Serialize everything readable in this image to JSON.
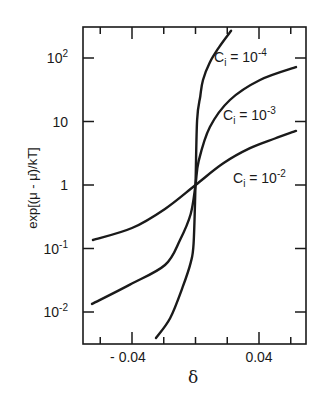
{
  "chart_data": {
    "type": "line",
    "title": "",
    "xlabel": "δ",
    "ylabel": "exp[(μ - μ̄)/kT]",
    "xscale": "linear",
    "yscale": "log",
    "xlim": [
      -0.071,
      0.07
    ],
    "ylim": [
      0.0032,
      310
    ],
    "grid": false,
    "legend": "inline labels",
    "x_ticks": {
      "major": [
        -0.04,
        0.04
      ],
      "minor": [
        -0.06,
        -0.02,
        0.0,
        0.02,
        0.06
      ],
      "labels": [
        "- 0.04",
        "0.04"
      ]
    },
    "y_ticks": {
      "values": [
        0.01,
        0.1,
        1,
        10,
        100
      ],
      "labels": [
        {
          "base": "10",
          "exp": "-2"
        },
        {
          "base": "10",
          "exp": "-1"
        },
        {
          "base": "1",
          "exp": ""
        },
        {
          "base": "10",
          "exp": ""
        },
        {
          "base": "10",
          "exp": "2"
        }
      ]
    },
    "series": [
      {
        "name": "Ci = 10^-4",
        "label": {
          "prefix": "C",
          "sub": "i",
          "eq": " = 10",
          "exp": "-4"
        },
        "points": [
          [
            -0.0249,
            0.0039
          ],
          [
            -0.016,
            0.008
          ],
          [
            -0.008,
            0.025
          ],
          [
            -0.003,
            0.06
          ],
          [
            -0.0012,
            0.12
          ],
          [
            0.0,
            1.0
          ],
          [
            0.001,
            10.5
          ],
          [
            0.003,
            25
          ],
          [
            0.0047,
            45
          ],
          [
            0.009,
            85
          ],
          [
            0.015,
            150
          ],
          [
            0.0224,
            268
          ]
        ]
      },
      {
        "name": "Ci = 10^-3",
        "label": {
          "prefix": "C",
          "sub": "i",
          "eq": " = 10",
          "exp": "-3"
        },
        "points": [
          [
            -0.0652,
            0.0134
          ],
          [
            -0.0413,
            0.027
          ],
          [
            -0.0192,
            0.055
          ],
          [
            -0.0098,
            0.135
          ],
          [
            -0.003,
            0.35
          ],
          [
            0.0,
            1.0
          ],
          [
            0.002,
            2.4
          ],
          [
            0.0091,
            8.2
          ],
          [
            0.0217,
            21.8
          ],
          [
            0.0406,
            45
          ],
          [
            0.0633,
            72
          ]
        ]
      },
      {
        "name": "Ci = 10^-2",
        "label": {
          "prefix": "C",
          "sub": "i",
          "eq": " = 10",
          "exp": "-2"
        },
        "points": [
          [
            -0.0646,
            0.136
          ],
          [
            -0.04,
            0.21
          ],
          [
            -0.0192,
            0.42
          ],
          [
            0.0,
            1.0
          ],
          [
            0.0175,
            2.2
          ],
          [
            0.0343,
            3.8
          ],
          [
            0.05,
            5.4
          ],
          [
            0.0633,
            7.1
          ]
        ]
      }
    ]
  }
}
